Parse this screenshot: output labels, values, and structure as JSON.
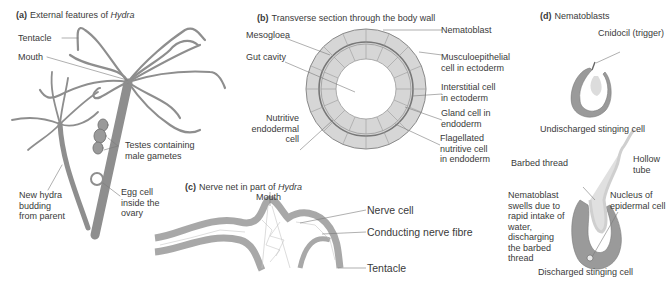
{
  "panels": {
    "a": {
      "letter": "(a)",
      "title": "External features of ",
      "title_italic": "Hydra",
      "labels": {
        "tentacle": "Tentacle",
        "mouth": "Mouth",
        "testes": "Testes containing\nmale gametes",
        "budding": "New hydra\nbudding\nfrom parent",
        "egg": "Egg cell\ninside the\novary"
      }
    },
    "b": {
      "letter": "(b)",
      "title": "Transverse section through the body wall",
      "labels": {
        "mesogloea": "Mesogloea",
        "gut_cavity": "Gut cavity",
        "nutritive": "Nutritive\nendodermal\ncell",
        "nematoblast": "Nematoblast",
        "musculoepithelial": "Musculoepithelial\ncell in ectoderm",
        "interstitial": "Interstitial cell\nin ectoderm",
        "gland": "Gland cell in\nendoderm",
        "flagellated": "Flagellated\nnutritive cell\nin endoderm"
      }
    },
    "c": {
      "letter": "(c)",
      "title": "Nerve net in part of ",
      "title_italic": "Hydra",
      "labels": {
        "mouth": "Mouth",
        "nerve_cell": "Nerve cell",
        "nerve_fibre": "Conducting nerve fibre",
        "tentacle": "Tentacle"
      }
    },
    "d": {
      "letter": "(d)",
      "title": "Nematoblasts",
      "labels": {
        "cnidocil": "Cnidocil (trigger)",
        "undischarged": "Undischarged stinging cell",
        "barbed": "Barbed thread",
        "hollow": "Hollow\ntube",
        "swells": "Nematoblast\nswells due to\nrapid intake of\nwater,\ndischarging\nthe barbed\nthread",
        "nucleus": "Nucleus of\nepidermal cell",
        "discharged": "Discharged stinging cell"
      }
    }
  },
  "colors": {
    "body": "#8e8e8e",
    "cell_fill": "#d9d9d9",
    "line": "#7a7a7a",
    "text": "#3a3a3a"
  }
}
